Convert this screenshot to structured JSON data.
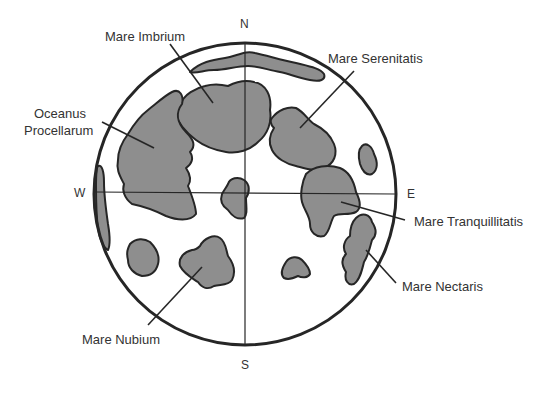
{
  "diagram": {
    "colors": {
      "mare_fill": "#8e8e8e",
      "outline": "#262626",
      "text": "#333333",
      "background": "#ffffff"
    },
    "directions": {
      "north": "N",
      "south": "S",
      "west": "W",
      "east": "E"
    },
    "labels": {
      "mare_imbrium": "Mare Imbrium",
      "mare_serenitatis": "Mare Serenitatis",
      "oceanus_line1": "Oceanus",
      "oceanus_line2": "Procellarum",
      "mare_tranquillitatis": "Mare Tranquillitatis",
      "mare_nectaris": "Mare Nectaris",
      "mare_nubium": "Mare Nubium"
    }
  }
}
